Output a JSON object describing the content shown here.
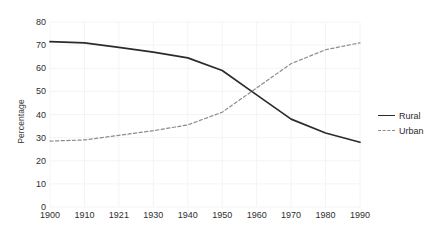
{
  "chart_data": {
    "type": "line",
    "title": "",
    "xlabel": "",
    "ylabel": "Percentage",
    "x": [
      1900,
      1910,
      1921,
      1930,
      1940,
      1950,
      1960,
      1970,
      1980,
      1990
    ],
    "xtick_labels": [
      "1900",
      "1910",
      "1921",
      "1930",
      "1940",
      "1950",
      "1960",
      "1970",
      "1980",
      "1990"
    ],
    "ytick_labels": [
      "0",
      "10",
      "20",
      "30",
      "40",
      "50",
      "60",
      "70",
      "80"
    ],
    "yticks": [
      0,
      10,
      20,
      30,
      40,
      50,
      60,
      70,
      80
    ],
    "xlim": [
      1900,
      1990
    ],
    "ylim": [
      0,
      80
    ],
    "grid": true,
    "grid_color": "#f4f4f4",
    "legend_position": "right-outside",
    "series": [
      {
        "name": "Rural",
        "style": "solid",
        "color": "#2b2b2b",
        "values": [
          71.5,
          71.0,
          69.0,
          67.0,
          64.5,
          59.0,
          48.5,
          38.0,
          32.0,
          28.0
        ]
      },
      {
        "name": "Urban",
        "style": "dashed",
        "color": "#8c8c8c",
        "values": [
          28.5,
          29.0,
          31.0,
          33.0,
          35.5,
          41.0,
          51.5,
          62.0,
          68.0,
          71.0
        ]
      }
    ]
  },
  "legend": {
    "items": [
      {
        "label": "Rural"
      },
      {
        "label": "Urban"
      }
    ]
  }
}
